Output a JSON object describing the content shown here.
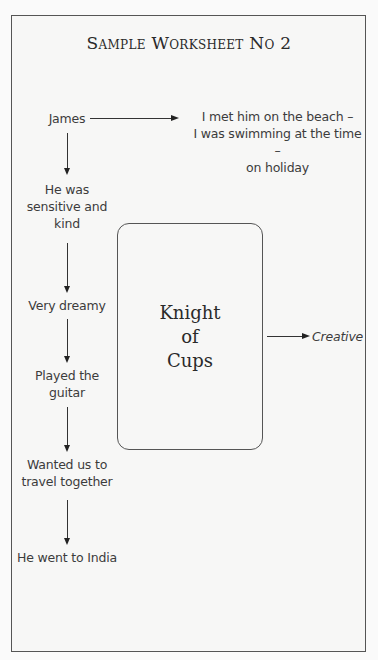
{
  "worksheet": {
    "title": "Sample Worksheet No 2"
  },
  "diagram": {
    "root": "James",
    "root_note": {
      "line1": "I met him on the beach –",
      "line2": "I was swimming at the time –",
      "line3": "on holiday"
    },
    "chain": [
      {
        "lines": [
          "He was",
          "sensitive and",
          "kind"
        ]
      },
      {
        "lines": [
          "Very dreamy"
        ]
      },
      {
        "lines": [
          "Played the",
          "guitar"
        ]
      },
      {
        "lines": [
          "Wanted us to",
          "travel together"
        ]
      },
      {
        "lines": [
          "He went to India"
        ]
      }
    ],
    "card": {
      "lines": [
        "Knight",
        "of",
        "Cups"
      ]
    },
    "card_note": "Creative"
  },
  "colors": {
    "background": "#fafafa",
    "line": "#333333",
    "text": "#3a3a3a"
  }
}
